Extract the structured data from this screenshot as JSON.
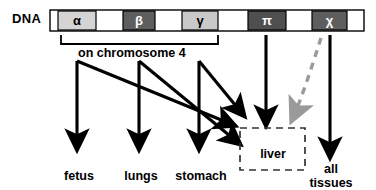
{
  "figure": {
    "dna_label": "DNA",
    "bracket_label": "on chromosome 4",
    "genes": [
      {
        "symbol": "α",
        "name": "alpha-globin-gene",
        "shade": "light",
        "x": 58,
        "width": 38
      },
      {
        "symbol": "β",
        "name": "beta-globin-gene",
        "shade": "dark",
        "x": 123,
        "width": 32
      },
      {
        "symbol": "γ",
        "name": "gamma-globin-gene",
        "shade": "light",
        "x": 182,
        "width": 36
      },
      {
        "symbol": "π",
        "name": "pi-globin-gene",
        "shade": "dark",
        "x": 248,
        "width": 38
      },
      {
        "symbol": "χ",
        "name": "chi-globin-gene",
        "shade": "dark",
        "x": 312,
        "width": 35
      }
    ],
    "targets": [
      {
        "label": "fetus",
        "name": "target-fetus"
      },
      {
        "label": "lungs",
        "name": "target-lungs"
      },
      {
        "label": "stomach",
        "name": "target-stomach"
      },
      {
        "label": "liver",
        "name": "target-liver"
      },
      {
        "label": "all tissues",
        "name": "target-all-tissues"
      }
    ],
    "liver_box_label": "liver",
    "all_tissues_line1": "all",
    "all_tissues_line2": "tissues",
    "colors": {
      "gene_light": "#d4d4d4",
      "gene_dark": "#5e5e5e",
      "gene_empty": "#ffffff",
      "stroke": "#000000",
      "dashed_gray": "#9a9a9a",
      "background": "#ffffff"
    }
  }
}
